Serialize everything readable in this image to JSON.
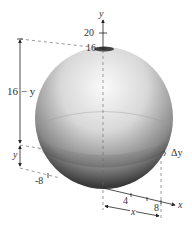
{
  "figure": {
    "type": "sphere-volume-diagram",
    "y_axis": {
      "label": "y",
      "ticks": [
        "20",
        "16"
      ]
    },
    "x_axis": {
      "label": "x",
      "ticks": [
        "-8",
        "4",
        "8"
      ]
    },
    "dimensions": {
      "top_segment": "16 − y",
      "bottom_segment": "y",
      "slice_thickness": "Δy",
      "radius": "x"
    },
    "colors": {
      "sphere_light": "#f4f4f4",
      "sphere_dark": "#3a3a3a",
      "line": "#222222",
      "dash": "#555555"
    }
  }
}
